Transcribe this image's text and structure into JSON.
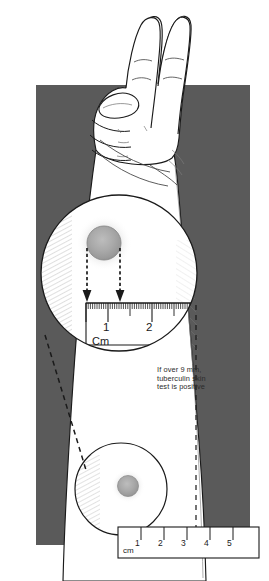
{
  "figure": {
    "background_color": "#ffffff",
    "panel_color": "#5a5a5a",
    "ink_color": "#1a1a1a",
    "skin_color": "#ffffff",
    "induration_color": "#a8a8a8"
  },
  "annotation": {
    "line1": "If over 9 mm,",
    "line2": "tuberculin skin",
    "line3": "test is positive"
  },
  "top_ruler": {
    "unit_label": "Cm",
    "ticks": [
      "1",
      "2"
    ],
    "measured_from": "0",
    "measured_to": "1"
  },
  "bottom_ruler": {
    "unit_label": "cm",
    "ticks": [
      "1",
      "2",
      "3",
      "4",
      "5"
    ]
  }
}
